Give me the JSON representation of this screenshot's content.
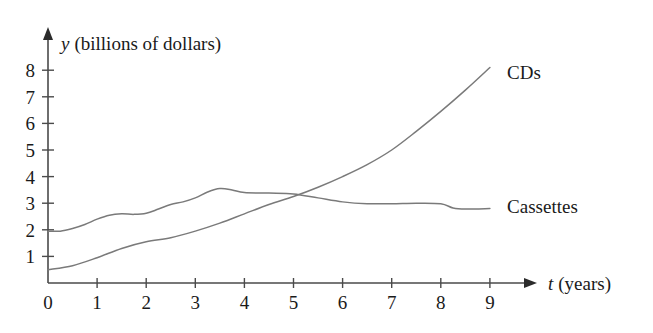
{
  "chart_data": {
    "type": "line",
    "title": "",
    "xlabel": "t (years)",
    "ylabel": "y (billions of dollars)",
    "xlabel_variable": "t",
    "xlabel_unit": "(years)",
    "ylabel_variable": "y",
    "ylabel_unit": "(billions of dollars)",
    "xlim": [
      0,
      9.6
    ],
    "ylim": [
      0,
      8.6
    ],
    "xticks": [
      0,
      1,
      2,
      3,
      4,
      5,
      6,
      7,
      8,
      9
    ],
    "xticklabels": [
      "0",
      "1",
      "2",
      "3",
      "4",
      "5",
      "6",
      "7",
      "8",
      "9"
    ],
    "yticks": [
      1,
      2,
      3,
      4,
      5,
      6,
      7,
      8
    ],
    "yticklabels": [
      "1",
      "2",
      "3",
      "4",
      "5",
      "6",
      "7",
      "8"
    ],
    "grid": false,
    "legend_position": "inline-right",
    "line_color": "#7a7a7a",
    "axis_color": "#4a4a4a",
    "series": [
      {
        "name": "Cassettes",
        "label": "Cassettes",
        "label_x": 9.35,
        "label_y": 2.85,
        "x": [
          0,
          0.25,
          0.5,
          0.75,
          1,
          1.25,
          1.5,
          1.75,
          2,
          2.25,
          2.5,
          2.75,
          3,
          3.25,
          3.5,
          3.75,
          4,
          4.5,
          5,
          5.5,
          6,
          6.5,
          7,
          7.5,
          8,
          8.25,
          8.5,
          9
        ],
        "values": [
          1.95,
          1.95,
          2.05,
          2.2,
          2.4,
          2.55,
          2.6,
          2.58,
          2.62,
          2.78,
          2.95,
          3.05,
          3.2,
          3.42,
          3.55,
          3.5,
          3.4,
          3.38,
          3.35,
          3.2,
          3.05,
          2.98,
          2.98,
          3.0,
          2.98,
          2.82,
          2.78,
          2.8
        ]
      },
      {
        "name": "CDs",
        "label": "CDs",
        "label_x": 9.35,
        "label_y": 7.9,
        "x": [
          0,
          0.5,
          1,
          1.5,
          2,
          2.5,
          3,
          3.5,
          4,
          4.5,
          5,
          5.5,
          6,
          6.5,
          7,
          7.5,
          8,
          8.5,
          9
        ],
        "values": [
          0.5,
          0.65,
          0.95,
          1.3,
          1.55,
          1.7,
          1.95,
          2.25,
          2.6,
          2.95,
          3.25,
          3.6,
          4.0,
          4.45,
          5.0,
          5.7,
          6.45,
          7.25,
          8.1
        ]
      }
    ]
  }
}
